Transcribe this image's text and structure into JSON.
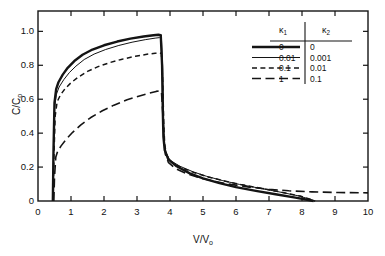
{
  "chart_data": {
    "type": "line",
    "title": "",
    "xlabel": "V/V₀",
    "ylabel": "C/C₀",
    "xlim": [
      0,
      10
    ],
    "ylim": [
      0,
      1.12
    ],
    "xticks": [
      0,
      1,
      2,
      3,
      4,
      5,
      6,
      7,
      8,
      9,
      10
    ],
    "xticklabels": [
      "0",
      "1",
      "2",
      "3",
      "4",
      "5",
      "6",
      "7",
      "8",
      "9",
      "10"
    ],
    "yticks": [
      0,
      0.2,
      0.4,
      0.6,
      0.8,
      1.0
    ],
    "yticklabels": [
      "0",
      "0.2",
      "0.4",
      "0.6",
      "0.8",
      "1.0"
    ],
    "grid": false,
    "legend_position": "top-right",
    "legend_columns": [
      "κ₁",
      "κ₂"
    ],
    "series": [
      {
        "name": "κ₁ = 0, κ₂ = 0",
        "kappa1": "0",
        "kappa2": "0",
        "style": "thick-solid",
        "points": [
          [
            0.45,
            0.0
          ],
          [
            0.47,
            0.3
          ],
          [
            0.5,
            0.58
          ],
          [
            0.55,
            0.66
          ],
          [
            0.62,
            0.7
          ],
          [
            0.75,
            0.745
          ],
          [
            0.9,
            0.785
          ],
          [
            1.1,
            0.825
          ],
          [
            1.35,
            0.862
          ],
          [
            1.65,
            0.893
          ],
          [
            2.0,
            0.918
          ],
          [
            2.4,
            0.94
          ],
          [
            2.8,
            0.957
          ],
          [
            3.2,
            0.97
          ],
          [
            3.5,
            0.977
          ],
          [
            3.65,
            0.98
          ],
          [
            3.72,
            0.978
          ],
          [
            3.76,
            0.8
          ],
          [
            3.78,
            0.55
          ],
          [
            3.8,
            0.38
          ],
          [
            3.84,
            0.3
          ],
          [
            3.95,
            0.245
          ],
          [
            4.2,
            0.205
          ],
          [
            4.6,
            0.163
          ],
          [
            5.0,
            0.133
          ],
          [
            5.5,
            0.105
          ],
          [
            6.0,
            0.082
          ],
          [
            6.6,
            0.06
          ],
          [
            7.2,
            0.04
          ],
          [
            7.8,
            0.02
          ],
          [
            8.2,
            0.006
          ],
          [
            8.35,
            0.0
          ]
        ]
      },
      {
        "name": "κ₁ = 0.01, κ₂ = 0.001",
        "kappa1": "0.01",
        "kappa2": "0.001",
        "style": "thin-solid",
        "points": [
          [
            0.45,
            0.0
          ],
          [
            0.47,
            0.28
          ],
          [
            0.5,
            0.55
          ],
          [
            0.56,
            0.63
          ],
          [
            0.64,
            0.672
          ],
          [
            0.78,
            0.715
          ],
          [
            0.95,
            0.757
          ],
          [
            1.15,
            0.795
          ],
          [
            1.4,
            0.834
          ],
          [
            1.7,
            0.866
          ],
          [
            2.05,
            0.893
          ],
          [
            2.45,
            0.917
          ],
          [
            2.85,
            0.936
          ],
          [
            3.25,
            0.951
          ],
          [
            3.55,
            0.96
          ],
          [
            3.68,
            0.963
          ],
          [
            3.74,
            0.96
          ],
          [
            3.78,
            0.78
          ],
          [
            3.8,
            0.52
          ],
          [
            3.82,
            0.36
          ],
          [
            3.88,
            0.285
          ],
          [
            4.0,
            0.24
          ],
          [
            4.3,
            0.205
          ],
          [
            4.7,
            0.172
          ],
          [
            5.1,
            0.146
          ],
          [
            5.6,
            0.12
          ],
          [
            6.1,
            0.098
          ],
          [
            6.7,
            0.076
          ],
          [
            7.3,
            0.054
          ],
          [
            7.9,
            0.03
          ],
          [
            8.25,
            0.01
          ],
          [
            8.38,
            0.0
          ]
        ]
      },
      {
        "name": "κ₁ = 0.1, κ₂ = 0.01",
        "kappa1": "0.1",
        "kappa2": "0.01",
        "style": "short-dash",
        "points": [
          [
            0.46,
            0.0
          ],
          [
            0.48,
            0.25
          ],
          [
            0.52,
            0.5
          ],
          [
            0.58,
            0.585
          ],
          [
            0.68,
            0.625
          ],
          [
            0.82,
            0.662
          ],
          [
            1.0,
            0.697
          ],
          [
            1.22,
            0.73
          ],
          [
            1.5,
            0.764
          ],
          [
            1.82,
            0.792
          ],
          [
            2.18,
            0.816
          ],
          [
            2.55,
            0.836
          ],
          [
            2.95,
            0.853
          ],
          [
            3.3,
            0.865
          ],
          [
            3.55,
            0.871
          ],
          [
            3.68,
            0.873
          ],
          [
            3.74,
            0.87
          ],
          [
            3.78,
            0.7
          ],
          [
            3.81,
            0.46
          ],
          [
            3.84,
            0.33
          ],
          [
            3.9,
            0.268
          ],
          [
            4.05,
            0.228
          ],
          [
            4.35,
            0.196
          ],
          [
            4.75,
            0.166
          ],
          [
            5.15,
            0.142
          ],
          [
            5.65,
            0.118
          ],
          [
            6.15,
            0.097
          ],
          [
            6.75,
            0.075
          ],
          [
            7.35,
            0.053
          ],
          [
            7.95,
            0.029
          ],
          [
            8.28,
            0.009
          ],
          [
            8.4,
            0.0
          ]
        ]
      },
      {
        "name": "κ₁ = 1, κ₂ = 0.1",
        "kappa1": "1",
        "kappa2": "0.1",
        "style": "long-dash",
        "points": [
          [
            0.48,
            0.0
          ],
          [
            0.5,
            0.14
          ],
          [
            0.54,
            0.26
          ],
          [
            0.6,
            0.295
          ],
          [
            0.7,
            0.325
          ],
          [
            0.85,
            0.363
          ],
          [
            1.05,
            0.405
          ],
          [
            1.3,
            0.449
          ],
          [
            1.6,
            0.492
          ],
          [
            1.95,
            0.532
          ],
          [
            2.3,
            0.565
          ],
          [
            2.7,
            0.597
          ],
          [
            3.05,
            0.618
          ],
          [
            3.35,
            0.635
          ],
          [
            3.58,
            0.646
          ],
          [
            3.68,
            0.649
          ],
          [
            3.74,
            0.646
          ],
          [
            3.78,
            0.52
          ],
          [
            3.82,
            0.36
          ],
          [
            3.86,
            0.275
          ],
          [
            3.95,
            0.228
          ],
          [
            4.15,
            0.193
          ],
          [
            4.5,
            0.162
          ],
          [
            4.9,
            0.137
          ],
          [
            5.35,
            0.115
          ],
          [
            5.85,
            0.098
          ],
          [
            6.4,
            0.082
          ],
          [
            7.0,
            0.069
          ],
          [
            7.6,
            0.06
          ],
          [
            8.3,
            0.054
          ],
          [
            9.1,
            0.05
          ],
          [
            10.0,
            0.048
          ]
        ]
      }
    ]
  },
  "axes": {
    "y_tick_labels": [
      "1.0",
      "0.8",
      "0.6",
      "0.4",
      "0.2",
      "0"
    ],
    "x_tick_labels": [
      "0",
      "1",
      "2",
      "3",
      "4",
      "5",
      "6",
      "7",
      "8",
      "9",
      "10"
    ],
    "x_title": "V/V",
    "x_title_sub": "o",
    "y_title": "C/C",
    "y_title_sub": "o"
  },
  "legend": {
    "header_1": "κ",
    "header_1_sub": "1",
    "header_2": "κ",
    "header_2_sub": "2",
    "rows": [
      {
        "k1": "0",
        "k2": "0",
        "style": "thick-solid"
      },
      {
        "k1": "0.01",
        "k2": "0.001",
        "style": "thin-solid"
      },
      {
        "k1": "0.1",
        "k2": "0.01",
        "style": "short-dash"
      },
      {
        "k1": "1",
        "k2": "0.1",
        "style": "long-dash"
      }
    ]
  },
  "style": {
    "line_color": "#141414",
    "axis_color": "#141414",
    "background": "#ffffff"
  }
}
